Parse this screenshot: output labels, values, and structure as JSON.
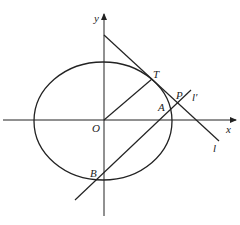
{
  "diagram": {
    "type": "ellipse-tangent-figure",
    "labels": {
      "y_axis": "y",
      "x_axis": "x",
      "origin": "O",
      "tangent_point": "T",
      "point_p": "P",
      "point_a": "A",
      "point_b": "B",
      "line_l": "l",
      "line_l_prime": "l′"
    },
    "stroke_color": "#222222",
    "background": "#ffffff"
  }
}
